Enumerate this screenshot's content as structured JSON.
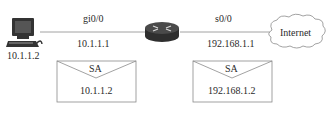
{
  "nodes": {
    "pc": {
      "icon": "computer-icon",
      "ip_label": "10.1.1.2"
    },
    "router": {
      "icon": "router-icon"
    },
    "internet": {
      "icon": "cloud-icon",
      "label": "Internet"
    }
  },
  "links": [
    {
      "from": "pc",
      "to": "router",
      "interface": "gi0/0",
      "ip": "10.1.1.1"
    },
    {
      "from": "router",
      "to": "internet",
      "interface": "s0/0",
      "ip": "192.168.1.1"
    }
  ],
  "packets": [
    {
      "icon": "envelope-icon",
      "field": "SA",
      "value": "10.1.1.2"
    },
    {
      "icon": "envelope-icon",
      "field": "SA",
      "value": "192.168.1.2"
    }
  ],
  "colors": {
    "line": "#8a8a8a",
    "router_body": "#3c3c3c",
    "text": "#2a2a2a"
  }
}
